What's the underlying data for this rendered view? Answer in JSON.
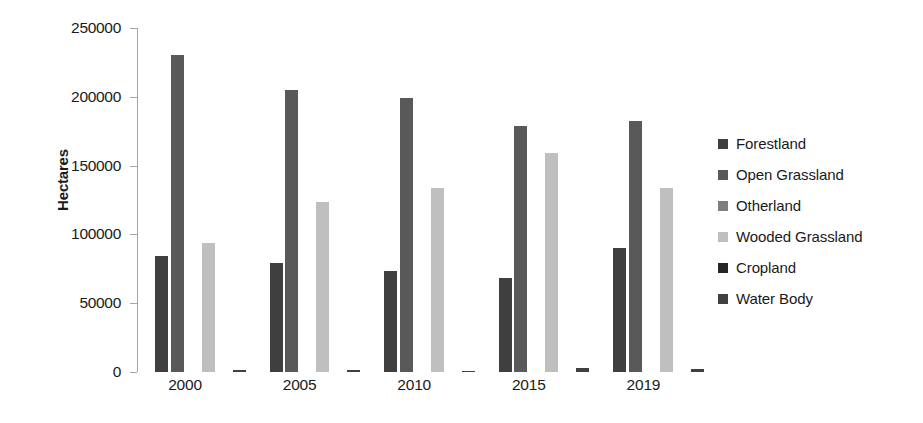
{
  "chart_data": {
    "type": "bar",
    "title": "",
    "subtitle": "",
    "xlabel": "",
    "ylabel": "Hectares",
    "categories": [
      "2000",
      "2005",
      "2010",
      "2015",
      "2019"
    ],
    "ylim": [
      0,
      250000
    ],
    "ytick_values": [
      0,
      50000,
      100000,
      150000,
      200000,
      250000
    ],
    "ytick_labels": [
      "0",
      "50000",
      "100000",
      "150000",
      "200000",
      "250000"
    ],
    "grid": false,
    "legend_position": "right",
    "series": [
      {
        "name": "Forestland",
        "color": "#3f3f3f",
        "values": [
          84000,
          79000,
          73500,
          68500,
          90000
        ]
      },
      {
        "name": "Open Grassland",
        "color": "#595959",
        "values": [
          230500,
          205000,
          199500,
          178500,
          182500
        ]
      },
      {
        "name": "Otherland",
        "color": "#7f7f7f",
        "values": [
          0,
          0,
          0,
          0,
          0
        ]
      },
      {
        "name": "Wooded Grassland",
        "color": "#bfbfbf",
        "values": [
          94000,
          123500,
          134000,
          159000,
          134000
        ]
      },
      {
        "name": "Cropland",
        "color": "#262626",
        "values": [
          0,
          0,
          0,
          0,
          0
        ]
      },
      {
        "name": "Water Body",
        "color": "#404040",
        "values": [
          1800,
          1500,
          1100,
          2600,
          2300
        ]
      }
    ]
  },
  "legend": {
    "items": [
      {
        "label": "Forestland"
      },
      {
        "label": "Open Grassland"
      },
      {
        "label": "Otherland"
      },
      {
        "label": "Wooded Grassland"
      },
      {
        "label": "Cropland"
      },
      {
        "label": "Water Body"
      }
    ]
  },
  "axis": {
    "y_title": "Hectares"
  }
}
